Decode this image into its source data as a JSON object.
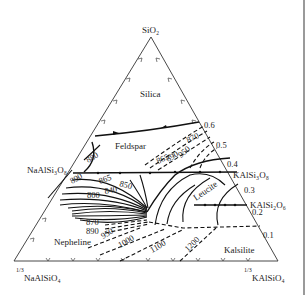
{
  "diagram": {
    "type": "ternary phase diagram",
    "vertices": {
      "top": "SiO₂",
      "bottom_left_frac": "1/3",
      "bottom_left": "NaAlSiO₄",
      "bottom_right_frac": "1/3",
      "bottom_right": "KAlSiO₄"
    },
    "side_compounds": {
      "left": "NaAlSi₃O₈",
      "right_upper": "KAlSi₃O₈",
      "right_lower": "KAlSi₂O₆"
    },
    "fields": {
      "silica": "Silica",
      "feldspar": "Feldspar",
      "leucite": "Leucite",
      "nepheline": "Nepheline",
      "kalsilite": "Kalsilite"
    },
    "right_axis_ticks": [
      "0.6",
      "0.5",
      "0.4",
      "0.3",
      "0.2",
      "0.1"
    ],
    "isotherms": {
      "t880": "880",
      "t890a": "890",
      "t865": "865",
      "t850": "850",
      "t840": "840",
      "t800": "800",
      "t870a": "870",
      "t890b": "890",
      "t950a": "950",
      "t1000": "1000",
      "t1100": "1100",
      "t1200": "1200",
      "t865b": "865",
      "t890c": "890",
      "t950b": "950",
      "t870b": "870"
    },
    "colors": {
      "line": "#111111",
      "text": "#222222",
      "background": "#ffffff",
      "border": "#9a9a9a"
    }
  }
}
